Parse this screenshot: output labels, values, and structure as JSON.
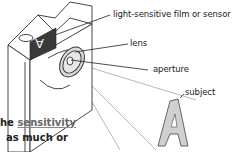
{
  "diagram": {
    "type": "camera-optics",
    "labels": {
      "sensor": "light-sensitive film or sensor",
      "lens": "lens",
      "aperture": "aperture",
      "subject": "subject"
    },
    "subject_glyph": "A",
    "inverted_image_glyph": "A"
  },
  "body_text": {
    "line1_prefix": "he ",
    "line1_link": "sensitivity",
    "line2": "as much or"
  },
  "colors": {
    "line": "#333333",
    "light_ray": "#999999",
    "sensor_fill": "#3a3a3a",
    "lens_fill": "#d9d9d9",
    "subject_fill": "#d0d0d0",
    "link": "#666666"
  }
}
